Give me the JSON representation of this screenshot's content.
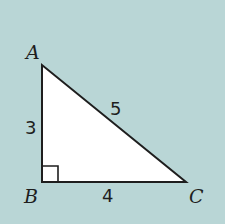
{
  "diagram": {
    "type": "right-triangle",
    "background_color": "#b9d6d6",
    "fill_color": "#ffffff",
    "stroke_color": "#1e1e1e",
    "vertices": {
      "A": {
        "label": "A",
        "x": 42,
        "y": 65
      },
      "B": {
        "label": "B",
        "x": 42,
        "y": 182
      },
      "C": {
        "label": "C",
        "x": 186,
        "y": 182
      }
    },
    "sides": {
      "AB": {
        "label": "3",
        "length": 3
      },
      "BC": {
        "label": "4",
        "length": 4
      },
      "AC": {
        "label": "5",
        "length": 5
      }
    },
    "right_angle_at": "B"
  }
}
